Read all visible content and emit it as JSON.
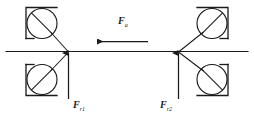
{
  "figure": {
    "type": "force-diagram",
    "background_color": "#ffffff",
    "stroke_color": "#1a1a1a",
    "labels": {
      "axial_force": {
        "symbol": "F",
        "subscript": "a"
      },
      "radial_force_left": {
        "symbol": "F",
        "subscript": "r1"
      },
      "radial_force_right": {
        "symbol": "F",
        "subscript": "r2"
      }
    },
    "elements": {
      "horizontal_axis_label": "workpiece-axis",
      "axial_arrow_direction": "left",
      "radial_arrow_left_direction": "up",
      "radial_arrow_right_direction": "up",
      "roller_count": 4,
      "roller_names": [
        "roller-top-left",
        "roller-bottom-left",
        "roller-top-right",
        "roller-bottom-right"
      ],
      "contact_point_left": "contact-point-1",
      "contact_point_right": "contact-point-2"
    }
  }
}
